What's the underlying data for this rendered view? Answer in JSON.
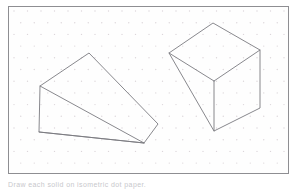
{
  "page": {
    "width": 298,
    "height": 190,
    "background_color": "#ffffff",
    "caption_text": "Draw each solid on isometric dot paper."
  },
  "worksheet": {
    "name": "isometric-dot-paper-worksheet",
    "border_color": "#8e8e92",
    "fill_color": "#fefefe",
    "x": 8,
    "y": 6,
    "width": 281,
    "height": 168
  },
  "dot_grid": {
    "name": "isometric-dot-grid",
    "dot_color": "#dcd6da",
    "dot_radius": 0.7,
    "column_spacing": 13.5,
    "row_spacing": 11.7,
    "stagger": "triangular",
    "visible": true
  },
  "figures": {
    "stroke_color": "#7a7a80",
    "fill_color": "none",
    "stroke_width": 0.9,
    "items": [
      {
        "name": "triangular-prism-wedge",
        "label": "Triangular prism (wedge)",
        "position": "left",
        "vertices": {
          "top_back_left": [
            39,
            85
          ],
          "top_apex": [
            88,
            52
          ],
          "bottom_back_left": [
            38,
            131
          ],
          "bottom_front": [
            143,
            142
          ],
          "right_upper": [
            157,
            123
          ]
        },
        "outline_path": "M 39 85 L 88 52 L 157 123 L 143 142 L 38 131 Z",
        "inner_edges": [
          "M 39 85 L 143 142",
          "M 38 131 L 143 142"
        ]
      },
      {
        "name": "rectangular-prism-cube",
        "label": "Rectangular prism (cube)",
        "position": "right",
        "vertices": {
          "top_apex": [
            212,
            22
          ],
          "top_left": [
            168,
            52
          ],
          "top_right": [
            259,
            49
          ],
          "center_front_top": [
            213,
            80
          ],
          "bottom_front": [
            213,
            130
          ],
          "bottom_right": [
            259,
            107
          ]
        },
        "outline_path": "M 212 22 L 259 49 L 259 107 L 213 130 L 168 52 Z",
        "inner_edges": [
          "M 168 52 L 213 80",
          "M 213 80 L 259 49",
          "M 213 80 L 213 130"
        ]
      }
    ]
  }
}
